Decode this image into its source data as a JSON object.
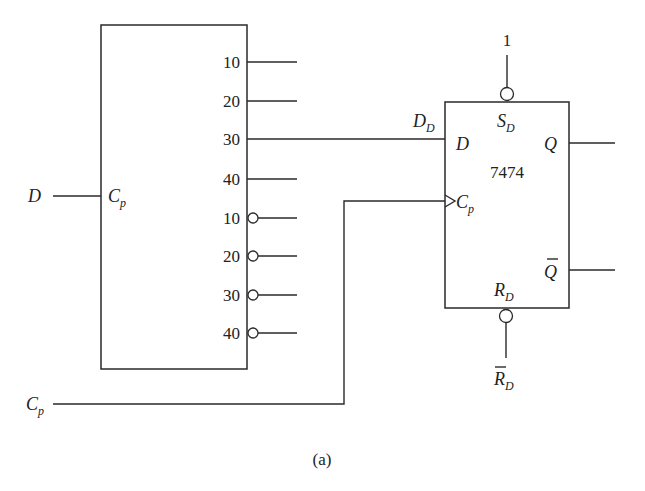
{
  "figure": {
    "caption": "(a)"
  },
  "left_block": {
    "clock_input_label": "C",
    "clock_input_sub": "p",
    "external_input_label": "D",
    "outputs": [
      {
        "label": "10",
        "inverted": false
      },
      {
        "label": "20",
        "inverted": false
      },
      {
        "label": "30",
        "inverted": false
      },
      {
        "label": "40",
        "inverted": false
      },
      {
        "label": "10",
        "inverted": true
      },
      {
        "label": "20",
        "inverted": true
      },
      {
        "label": "30",
        "inverted": true
      },
      {
        "label": "40",
        "inverted": true
      }
    ]
  },
  "flip_flop": {
    "part_number": "7474",
    "set_value": "1",
    "set_label": "S",
    "set_sub": "D",
    "data_pin_label": "D",
    "data_net_label": "D",
    "data_net_sub": "D",
    "clock_label": "C",
    "clock_sub": "p",
    "q_label": "Q",
    "qbar_label": "Q",
    "reset_label": "R",
    "reset_sub": "D",
    "reset_input_label": "R",
    "reset_input_sub": "D"
  },
  "clock_line": {
    "label": "C",
    "sub": "p"
  }
}
